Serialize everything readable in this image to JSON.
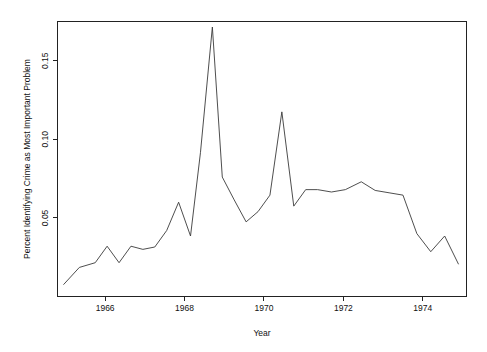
{
  "chart_data": {
    "type": "line",
    "title": "",
    "xlabel": "Year",
    "ylabel": "Percent Identifying Crime as Most Important Problem",
    "xlim": [
      1964.8,
      1975.1
    ],
    "ylim": [
      0.0,
      0.175
    ],
    "xticks": [
      1966,
      1968,
      1970,
      1972,
      1974
    ],
    "xtick_labels": [
      "1966",
      "1968",
      "1970",
      "1972",
      "1974"
    ],
    "yticks": [
      0.05,
      0.1,
      0.15
    ],
    "ytick_labels": [
      "0.05",
      "0.10",
      "0.15"
    ],
    "grid": false,
    "legend": null,
    "line_color": "#3a3a3a",
    "series": [
      {
        "name": "Percent Identifying Crime as Most Important Problem",
        "x": [
          1964.95,
          1965.35,
          1965.75,
          1966.05,
          1966.35,
          1966.65,
          1966.95,
          1967.25,
          1967.55,
          1967.85,
          1968.15,
          1968.4,
          1968.7,
          1968.95,
          1969.25,
          1969.55,
          1969.85,
          1970.15,
          1970.45,
          1970.75,
          1971.05,
          1971.35,
          1971.7,
          1972.05,
          1972.45,
          1972.8,
          1973.15,
          1973.5,
          1973.85,
          1974.2,
          1974.55,
          1974.9
        ],
        "y": [
          0.0075,
          0.0185,
          0.0215,
          0.032,
          0.0215,
          0.032,
          0.03,
          0.0315,
          0.042,
          0.06,
          0.0385,
          0.0915,
          0.1715,
          0.076,
          0.0615,
          0.0475,
          0.054,
          0.0645,
          0.1175,
          0.0575,
          0.068,
          0.068,
          0.0665,
          0.068,
          0.073,
          0.0675,
          0.066,
          0.0645,
          0.04,
          0.0285,
          0.0385,
          0.0205
        ]
      }
    ]
  },
  "axes": {
    "x_title": "Year",
    "y_title": "Percent Identifying Crime as Most Important Problem"
  }
}
